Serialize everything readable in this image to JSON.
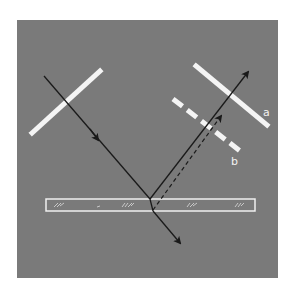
{
  "figure": {
    "background_color": "#7a7a7a",
    "page_color": "#ffffff",
    "mirror_color": "#f4f4f4",
    "ray_color": "#1a1a1a",
    "slab_outline_color": "#f0f0f0"
  },
  "labels": {
    "mirror_a": "a",
    "mirror_b": "b"
  },
  "elements": {
    "panel": {
      "x": 17,
      "y": 20,
      "w": 261,
      "h": 258
    },
    "mirror_left": {
      "x1": 32,
      "y1": 133,
      "x2": 100,
      "y2": 71
    },
    "mirror_a": {
      "x1": 196,
      "y1": 66,
      "x2": 267,
      "y2": 125
    },
    "mirror_b_dashed": {
      "x1": 173,
      "y1": 99,
      "x2": 244,
      "y2": 154
    },
    "slab": {
      "x": 46,
      "y": 199,
      "w": 209,
      "h": 12
    },
    "incident_ray": {
      "x1": 44,
      "y1": 76,
      "x2": 150,
      "y2": 199
    },
    "reflected_ray": {
      "x1": 150,
      "y1": 199,
      "x2": 248,
      "y2": 72
    },
    "refracted_inside": {
      "x1": 150,
      "y1": 199,
      "x2": 153,
      "y2": 211
    },
    "transmitted_ray": {
      "x1": 153,
      "y1": 211,
      "x2": 180,
      "y2": 243
    },
    "dashed_ray": {
      "x1": 153,
      "y1": 210,
      "x2": 221,
      "y2": 116
    }
  }
}
